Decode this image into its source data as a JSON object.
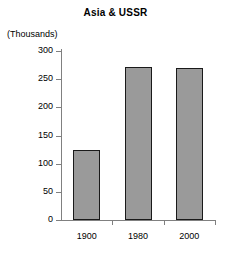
{
  "chart_data": {
    "type": "bar",
    "title": "Asia & USSR",
    "xlabel": "",
    "ylabel": "(Thousands)",
    "categories": [
      "1900",
      "1980",
      "2000"
    ],
    "values": [
      125,
      272,
      270
    ],
    "ylim": [
      0,
      300
    ],
    "yticks": [
      0,
      50,
      100,
      150,
      200,
      250,
      300
    ],
    "ytick_labels": [
      "0",
      "50",
      "100",
      "150",
      "200",
      "250",
      "300"
    ],
    "grid": false,
    "legend": null,
    "series": [
      {
        "name": "Asia & USSR",
        "values": [
          125,
          272,
          270
        ],
        "color": "#9a9a9a",
        "border_color": "#1a1a1a"
      }
    ]
  },
  "axis": {
    "line_color": "#808080"
  }
}
